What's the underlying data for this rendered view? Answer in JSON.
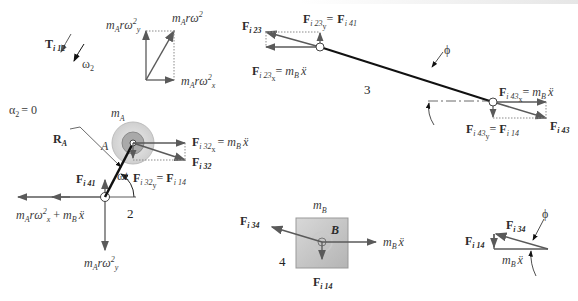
{
  "figure": {
    "links": {
      "crank": "2",
      "coupler": "3",
      "slider": "4"
    },
    "angles": {
      "alpha": "α",
      "alpha_sub": "2",
      "alpha_eq": "= 0",
      "omega": "ω",
      "omega_sub": "2",
      "omega_t": "ωt",
      "phi": "ϕ"
    },
    "points": {
      "A": "A",
      "B": "B"
    },
    "masses": {
      "mA": "m",
      "mA_sub": "A",
      "mB": "m",
      "mB_sub": "B"
    },
    "torque": {
      "T": "T",
      "sub": "i 12"
    },
    "R_A": {
      "R": "R",
      "sub": "A"
    },
    "labels": {
      "mArw2": "m",
      "mArw2_rest": "rω",
      "sup2": "2",
      "x": "x",
      "y": "y",
      "plus": "+",
      "eq": "=",
      "xddot": "ẍ",
      "F": "F",
      "F_i41": "i 41",
      "F_i32": "i 32",
      "F_i14": "i 14",
      "F_i23": "i 23",
      "F_i43": "i 43",
      "F_i34": "i 34"
    },
    "colors": {
      "vector": "#5a5a5a",
      "link": "#111111",
      "hub_outer": "#d9d9d9",
      "hub_inner": "#a8a8a8",
      "slider": "#c8c8c8",
      "dotted": "#8a8a8a"
    }
  }
}
